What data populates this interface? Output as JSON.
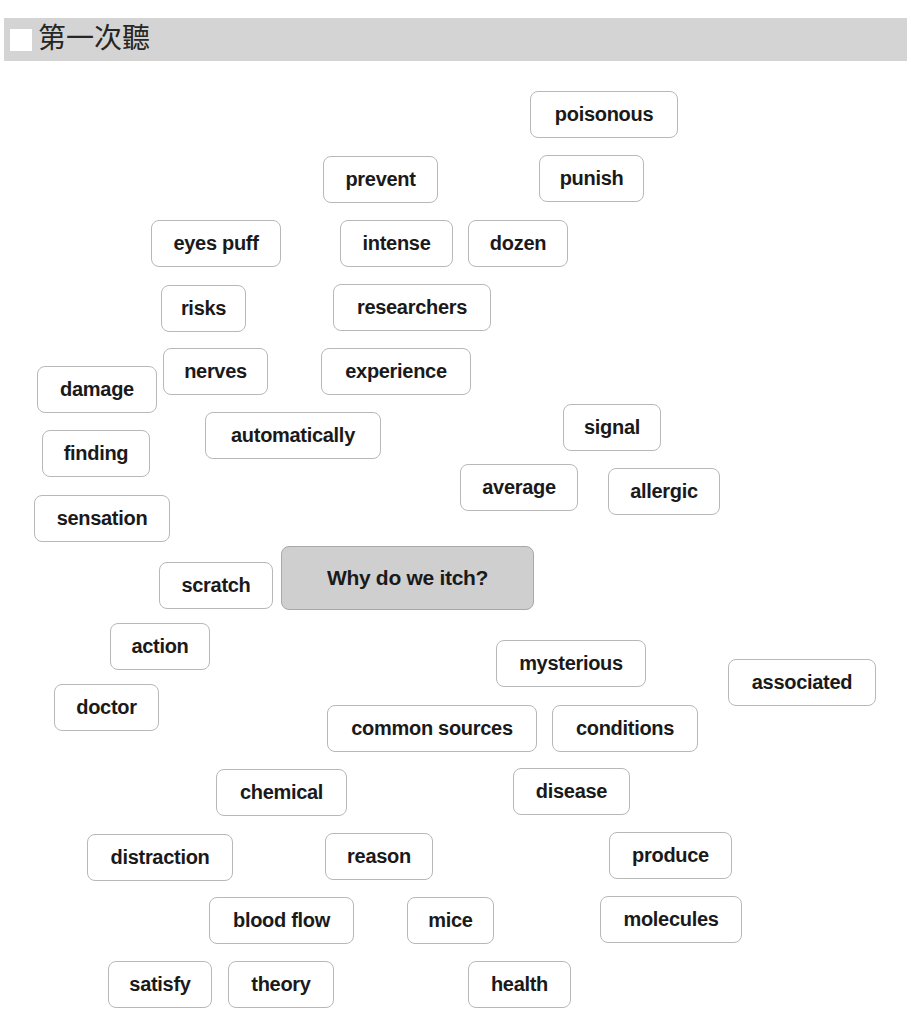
{
  "header": {
    "title": "第一次聽"
  },
  "center_topic": {
    "label": "Why do we itch?",
    "background": "#cfcfcf"
  },
  "words": [
    {
      "label": "poisonous",
      "x": 530,
      "y": 91,
      "w": 148
    },
    {
      "label": "prevent",
      "x": 323,
      "y": 156,
      "w": 115
    },
    {
      "label": "punish",
      "x": 539,
      "y": 155,
      "w": 105
    },
    {
      "label": "eyes puff",
      "x": 151,
      "y": 220,
      "w": 130
    },
    {
      "label": "intense",
      "x": 340,
      "y": 220,
      "w": 113
    },
    {
      "label": "dozen",
      "x": 468,
      "y": 220,
      "w": 100
    },
    {
      "label": "risks",
      "x": 161,
      "y": 285,
      "w": 85
    },
    {
      "label": "researchers",
      "x": 333,
      "y": 284,
      "w": 158
    },
    {
      "label": "nerves",
      "x": 163,
      "y": 348,
      "w": 105
    },
    {
      "label": "experience",
      "x": 321,
      "y": 348,
      "w": 150
    },
    {
      "label": "damage",
      "x": 37,
      "y": 366,
      "w": 120
    },
    {
      "label": "signal",
      "x": 563,
      "y": 404,
      "w": 98
    },
    {
      "label": "automatically",
      "x": 205,
      "y": 412,
      "w": 176
    },
    {
      "label": "finding",
      "x": 42,
      "y": 430,
      "w": 108
    },
    {
      "label": "average",
      "x": 460,
      "y": 464,
      "w": 118
    },
    {
      "label": "allergic",
      "x": 608,
      "y": 468,
      "w": 112
    },
    {
      "label": "sensation",
      "x": 34,
      "y": 495,
      "w": 136
    },
    {
      "label": "scratch",
      "x": 159,
      "y": 562,
      "w": 114
    },
    {
      "label": "action",
      "x": 110,
      "y": 623,
      "w": 100
    },
    {
      "label": "mysterious",
      "x": 496,
      "y": 640,
      "w": 150
    },
    {
      "label": "associated",
      "x": 728,
      "y": 659,
      "w": 148
    },
    {
      "label": "doctor",
      "x": 54,
      "y": 684,
      "w": 105
    },
    {
      "label": "common sources",
      "x": 327,
      "y": 705,
      "w": 210
    },
    {
      "label": "conditions",
      "x": 552,
      "y": 705,
      "w": 146
    },
    {
      "label": "chemical",
      "x": 216,
      "y": 769,
      "w": 131
    },
    {
      "label": "disease",
      "x": 513,
      "y": 768,
      "w": 117
    },
    {
      "label": "distraction",
      "x": 87,
      "y": 834,
      "w": 146
    },
    {
      "label": "reason",
      "x": 325,
      "y": 833,
      "w": 108
    },
    {
      "label": "produce",
      "x": 609,
      "y": 832,
      "w": 123
    },
    {
      "label": "blood flow",
      "x": 209,
      "y": 897,
      "w": 145
    },
    {
      "label": "mice",
      "x": 407,
      "y": 897,
      "w": 87
    },
    {
      "label": "molecules",
      "x": 600,
      "y": 896,
      "w": 142
    },
    {
      "label": "satisfy",
      "x": 108,
      "y": 961,
      "w": 104
    },
    {
      "label": "theory",
      "x": 228,
      "y": 961,
      "w": 106
    },
    {
      "label": "health",
      "x": 468,
      "y": 961,
      "w": 103
    }
  ]
}
